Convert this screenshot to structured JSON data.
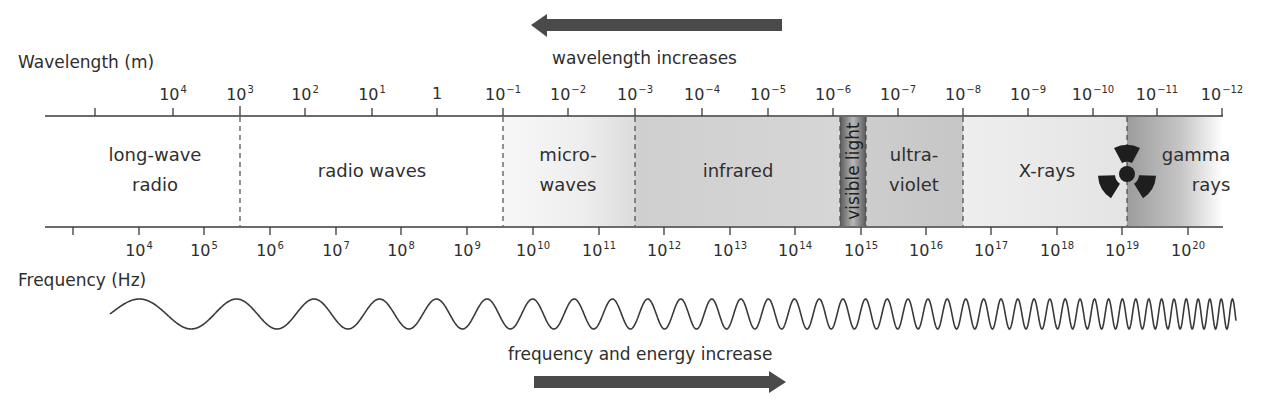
{
  "wavelength_axis": {
    "title": "Wavelength (m)",
    "ticks": [
      {
        "x": 173,
        "base": "10",
        "exp": "4"
      },
      {
        "x": 240,
        "base": "10",
        "exp": "3"
      },
      {
        "x": 305,
        "base": "10",
        "exp": "2"
      },
      {
        "x": 372,
        "base": "10",
        "exp": "1"
      },
      {
        "x": 437,
        "base": "1",
        "exp": ""
      },
      {
        "x": 503,
        "base": "10",
        "exp": "−1"
      },
      {
        "x": 568,
        "base": "10",
        "exp": "−2"
      },
      {
        "x": 635,
        "base": "10",
        "exp": "−3"
      },
      {
        "x": 702,
        "base": "10",
        "exp": "−4"
      },
      {
        "x": 768,
        "base": "10",
        "exp": "−5"
      },
      {
        "x": 833,
        "base": "10",
        "exp": "−6"
      },
      {
        "x": 898,
        "base": "10",
        "exp": "−7"
      },
      {
        "x": 963,
        "base": "10",
        "exp": "−8"
      },
      {
        "x": 1028,
        "base": "10",
        "exp": "−9"
      },
      {
        "x": 1093,
        "base": "10",
        "exp": "−10"
      },
      {
        "x": 1157,
        "base": "10",
        "exp": "−11"
      },
      {
        "x": 1222,
        "base": "10",
        "exp": "−12"
      }
    ],
    "arrow_label": "wavelength increases",
    "arrow_direction": "left"
  },
  "frequency_axis": {
    "title": "Frequency (Hz)",
    "ticks": [
      {
        "x": 139,
        "base": "10",
        "exp": "4"
      },
      {
        "x": 204,
        "base": "10",
        "exp": "5"
      },
      {
        "x": 270,
        "base": "10",
        "exp": "6"
      },
      {
        "x": 336,
        "base": "10",
        "exp": "7"
      },
      {
        "x": 401,
        "base": "10",
        "exp": "8"
      },
      {
        "x": 467,
        "base": "10",
        "exp": "9"
      },
      {
        "x": 533,
        "base": "10",
        "exp": "10"
      },
      {
        "x": 599,
        "base": "10",
        "exp": "11"
      },
      {
        "x": 664,
        "base": "10",
        "exp": "12"
      },
      {
        "x": 730,
        "base": "10",
        "exp": "13"
      },
      {
        "x": 795,
        "base": "10",
        "exp": "14"
      },
      {
        "x": 861,
        "base": "10",
        "exp": "15"
      },
      {
        "x": 926,
        "base": "10",
        "exp": "16"
      },
      {
        "x": 991,
        "base": "10",
        "exp": "17"
      },
      {
        "x": 1057,
        "base": "10",
        "exp": "18"
      },
      {
        "x": 1122,
        "base": "10",
        "exp": "19"
      },
      {
        "x": 1188,
        "base": "10",
        "exp": "20"
      }
    ],
    "arrow_label": "frequency and energy increase",
    "arrow_direction": "right"
  },
  "bands": [
    {
      "name": "long-wave radio",
      "lines": [
        "long-wave",
        "radio"
      ],
      "x": 155
    },
    {
      "name": "radio waves",
      "lines": [
        "radio waves"
      ],
      "x": 372
    },
    {
      "name": "microwaves",
      "lines": [
        "micro-",
        "waves"
      ],
      "x": 568
    },
    {
      "name": "infrared",
      "lines": [
        "infrared"
      ],
      "x": 738
    },
    {
      "name": "visible light",
      "lines": [
        "visible light"
      ],
      "x": 853
    },
    {
      "name": "ultraviolet",
      "lines": [
        "ultra-",
        "violet"
      ],
      "x": 914
    },
    {
      "name": "X-rays",
      "lines": [
        "X-rays"
      ],
      "x": 1047
    },
    {
      "name": "gamma rays",
      "lines": [
        "gamma",
        "rays"
      ],
      "x": 1196
    }
  ],
  "icons": {
    "radiation": "radiation-hazard-icon"
  },
  "colors": {
    "ink": "#2e2e2e",
    "arrow": "#4a4a4a",
    "microwave_fill": "#ececec",
    "infrared_fill": "#d0d0d0",
    "visible_fill": "#8a8a8a",
    "ultraviolet_fill": "#c8c8c8",
    "xray_fill": "#ececec",
    "gamma_fill": "#a8a8a8"
  }
}
